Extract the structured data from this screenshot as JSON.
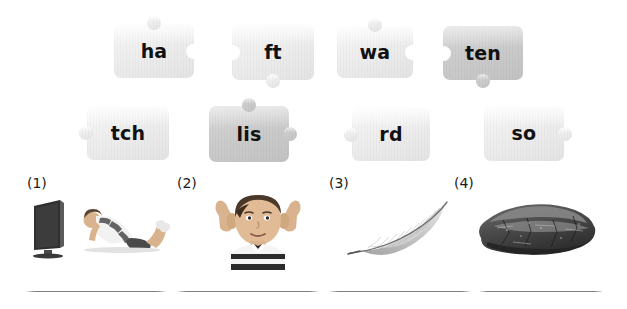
{
  "worksheet": {
    "type": "word-building-puzzle",
    "instruction_text": "",
    "puzzle_rows": [
      {
        "row": 1,
        "pieces": [
          {
            "text": "ha",
            "shade": "light",
            "knobs": [
              "top"
            ],
            "sockets": [
              "right"
            ]
          },
          {
            "text": "ft",
            "shade": "light",
            "knobs": [
              "bottom"
            ],
            "sockets": [
              "left"
            ]
          },
          {
            "text": "wa",
            "shade": "light",
            "knobs": [
              "top"
            ],
            "sockets": [
              "right"
            ]
          },
          {
            "text": "ten",
            "shade": "mid",
            "knobs": [
              "bottom"
            ],
            "sockets": [
              "left"
            ]
          }
        ]
      },
      {
        "row": 2,
        "pieces": [
          {
            "text": "tch",
            "shade": "light",
            "knobs": [
              "left"
            ],
            "sockets": []
          },
          {
            "text": "lis",
            "shade": "mid",
            "knobs": [
              "top",
              "right"
            ],
            "sockets": []
          },
          {
            "text": "rd",
            "shade": "light",
            "knobs": [
              "left"
            ],
            "sockets": []
          },
          {
            "text": "so",
            "shade": "light",
            "knobs": [
              "right"
            ],
            "sockets": []
          }
        ]
      }
    ],
    "items": [
      {
        "number": "(1)",
        "picture": "girl-watching-tv",
        "answer": ""
      },
      {
        "number": "(2)",
        "picture": "boy-cupping-ears",
        "answer": ""
      },
      {
        "number": "(3)",
        "picture": "feather",
        "answer": ""
      },
      {
        "number": "(4)",
        "picture": "rock",
        "answer": ""
      }
    ]
  },
  "colors": {
    "background": "#ffffff",
    "piece_light": "#eeeeee",
    "piece_mid": "#cccccc",
    "text": "#111111",
    "line": "#787878"
  }
}
